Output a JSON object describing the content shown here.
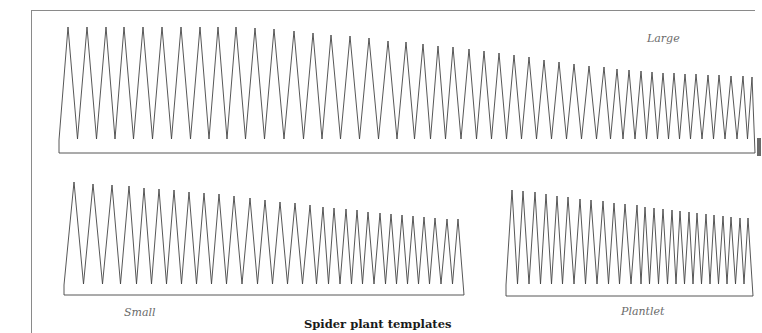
{
  "title": "Spider plant templates",
  "colors": {
    "stroke": "#444444",
    "baseline": "#777777",
    "frame": "#8a8a8a",
    "label": "#6a6a6a",
    "title": "#1a1a1a"
  },
  "templates": [
    {
      "name": "Large",
      "label": "Large",
      "label_pos": [
        647,
        32
      ],
      "baseline_y": 153,
      "start_x": 59,
      "end_x": 755,
      "start_y": 140,
      "valley_y": 139,
      "peaks": [
        [
          68,
          27
        ],
        [
          87,
          27
        ],
        [
          106,
          27
        ],
        [
          124,
          27
        ],
        [
          143,
          27
        ],
        [
          162,
          27
        ],
        [
          181,
          27
        ],
        [
          200,
          27
        ],
        [
          218,
          27
        ],
        [
          236,
          27
        ],
        [
          255,
          28
        ],
        [
          274,
          29
        ],
        [
          294,
          31
        ],
        [
          313,
          33
        ],
        [
          331,
          35
        ],
        [
          350,
          36
        ],
        [
          369,
          38
        ],
        [
          388,
          41
        ],
        [
          406,
          42
        ],
        [
          423,
          44
        ],
        [
          438,
          46
        ],
        [
          453,
          47
        ],
        [
          469,
          49
        ],
        [
          484,
          51
        ],
        [
          499,
          53
        ],
        [
          514,
          55
        ],
        [
          529,
          57
        ],
        [
          544,
          60
        ],
        [
          559,
          62
        ],
        [
          574,
          64
        ],
        [
          589,
          66
        ],
        [
          604,
          67
        ],
        [
          617,
          69
        ],
        [
          629,
          70
        ],
        [
          641,
          71
        ],
        [
          652,
          72
        ],
        [
          663,
          73
        ],
        [
          674,
          73
        ],
        [
          685,
          74
        ],
        [
          696,
          74
        ],
        [
          708,
          75
        ],
        [
          719,
          75
        ],
        [
          731,
          76
        ],
        [
          743,
          76
        ],
        [
          752,
          77
        ]
      ]
    },
    {
      "name": "Small",
      "label": "Small",
      "label_pos": [
        124,
        306
      ],
      "baseline_y": 295,
      "start_x": 64,
      "end_x": 464,
      "start_y": 285,
      "valley_y": 284,
      "peaks": [
        [
          74,
          182
        ],
        [
          93,
          184
        ],
        [
          112,
          185
        ],
        [
          129,
          186
        ],
        [
          144,
          188
        ],
        [
          159,
          189
        ],
        [
          174,
          190
        ],
        [
          189,
          192
        ],
        [
          204,
          193
        ],
        [
          219,
          194
        ],
        [
          234,
          196
        ],
        [
          250,
          198
        ],
        [
          265,
          200
        ],
        [
          280,
          202
        ],
        [
          295,
          203
        ],
        [
          310,
          205
        ],
        [
          323,
          207
        ],
        [
          334,
          208
        ],
        [
          346,
          209
        ],
        [
          357,
          210
        ],
        [
          368,
          212
        ],
        [
          380,
          213
        ],
        [
          391,
          214
        ],
        [
          402,
          215
        ],
        [
          413,
          216
        ],
        [
          424,
          217
        ],
        [
          435,
          218
        ],
        [
          447,
          219
        ],
        [
          458,
          219
        ]
      ]
    },
    {
      "name": "Plantlet",
      "label": "Plantlet",
      "label_pos": [
        621,
        305
      ],
      "baseline_y": 296,
      "start_x": 506,
      "end_x": 753,
      "start_y": 285,
      "valley_y": 284,
      "peaks": [
        [
          512,
          190
        ],
        [
          523,
          191
        ],
        [
          535,
          192
        ],
        [
          546,
          194
        ],
        [
          557,
          196
        ],
        [
          568,
          197
        ],
        [
          580,
          199
        ],
        [
          591,
          200
        ],
        [
          603,
          201
        ],
        [
          614,
          203
        ],
        [
          625,
          204
        ],
        [
          637,
          205
        ],
        [
          645,
          207
        ],
        [
          654,
          208
        ],
        [
          663,
          209
        ],
        [
          672,
          210
        ],
        [
          680,
          211
        ],
        [
          689,
          212
        ],
        [
          697,
          213
        ],
        [
          706,
          214
        ],
        [
          714,
          215
        ],
        [
          723,
          216
        ],
        [
          731,
          217
        ],
        [
          740,
          218
        ],
        [
          748,
          218
        ]
      ]
    }
  ]
}
